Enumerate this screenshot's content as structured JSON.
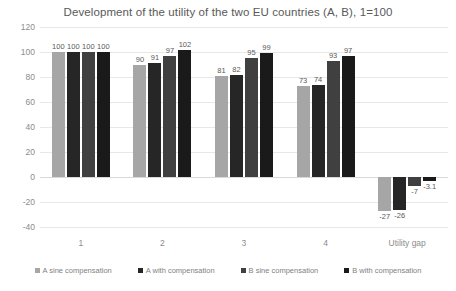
{
  "chart_data": {
    "type": "bar",
    "title": "Development of the utility of the two EU countries (A, B),  1=100",
    "xlabel": "",
    "ylabel": "",
    "ylim": [
      -40,
      120
    ],
    "yticks": [
      120,
      100,
      80,
      60,
      40,
      20,
      0,
      -20,
      -40
    ],
    "grid": true,
    "legend_position": "bottom",
    "categories": [
      "1",
      "2",
      "3",
      "4",
      "Utility gap"
    ],
    "series": [
      {
        "name": "A sine compensation",
        "color": "#a6a6a6",
        "values": [
          100,
          90,
          81,
          73,
          -27
        ],
        "labels": [
          "100",
          "90",
          "81",
          "73",
          "-27"
        ]
      },
      {
        "name": "A with compensation",
        "color": "#262626",
        "values": [
          100,
          91,
          82,
          74,
          -26
        ],
        "labels": [
          "100",
          "91",
          "82",
          "74",
          "-26"
        ]
      },
      {
        "name": "B sine compensation",
        "color": "#404040",
        "values": [
          100,
          97,
          95,
          93,
          -7
        ],
        "labels": [
          "100",
          "97",
          "95",
          "93",
          "-7"
        ]
      },
      {
        "name": "B with compensation",
        "color": "#1a1a1a",
        "values": [
          100,
          102,
          99,
          97,
          -3.1
        ],
        "labels": [
          "100",
          "102",
          "99",
          "97",
          "-3.1"
        ]
      }
    ]
  }
}
